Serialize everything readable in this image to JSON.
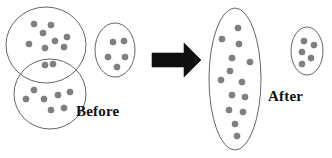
{
  "figure": {
    "background_color": "#ffffff",
    "outline_color": "#555555",
    "dot_color": "#808080",
    "dot_edge_color": "#6e6e6e",
    "arrow_color": "#111111",
    "caption_color": "#111111"
  },
  "captions": {
    "before": "Before",
    "after": "After"
  },
  "chart_data": {
    "type": "scatter",
    "xlabel": "",
    "ylabel": "",
    "xlim": [
      0,
      332
    ],
    "ylim": [
      0,
      158
    ],
    "grid": false,
    "legend": false,
    "annotations": [
      "Before",
      "After"
    ],
    "groups": [
      {
        "name": "before-top-left-cluster",
        "side": "before",
        "shape": "circle",
        "cx": 46,
        "cy": 45,
        "rx": 40,
        "ry": 38,
        "rotation": 0,
        "point_count": 8,
        "points": [
          {
            "x": 34,
            "y": 24
          },
          {
            "x": 51,
            "y": 25
          },
          {
            "x": 43,
            "y": 33
          },
          {
            "x": 67,
            "y": 37
          },
          {
            "x": 29,
            "y": 44
          },
          {
            "x": 45,
            "y": 48
          },
          {
            "x": 64,
            "y": 47
          },
          {
            "x": 55,
            "y": 41
          }
        ]
      },
      {
        "name": "before-bottom-left-cluster",
        "side": "before",
        "shape": "circle",
        "cx": 50,
        "cy": 94,
        "rx": 36,
        "ry": 35,
        "rotation": 0,
        "point_count": 9,
        "points": [
          {
            "x": 45,
            "y": 65
          },
          {
            "x": 53,
            "y": 64
          },
          {
            "x": 34,
            "y": 90
          },
          {
            "x": 26,
            "y": 99
          },
          {
            "x": 44,
            "y": 99
          },
          {
            "x": 58,
            "y": 95
          },
          {
            "x": 70,
            "y": 92
          },
          {
            "x": 51,
            "y": 110
          },
          {
            "x": 64,
            "y": 108
          }
        ]
      },
      {
        "name": "before-right-cluster",
        "side": "before",
        "shape": "ellipse",
        "cx": 115,
        "cy": 50,
        "rx": 20,
        "ry": 27,
        "rotation": 0,
        "point_count": 5,
        "points": [
          {
            "x": 113,
            "y": 42
          },
          {
            "x": 124,
            "y": 41
          },
          {
            "x": 108,
            "y": 57
          },
          {
            "x": 125,
            "y": 57
          },
          {
            "x": 117,
            "y": 67
          }
        ]
      },
      {
        "name": "after-merged-cluster",
        "side": "after",
        "shape": "ellipse",
        "cx": 235,
        "cy": 79,
        "rx": 26,
        "ry": 71,
        "rotation": 0,
        "point_count": 14,
        "points": [
          {
            "x": 238,
            "y": 28
          },
          {
            "x": 222,
            "y": 39
          },
          {
            "x": 239,
            "y": 44
          },
          {
            "x": 232,
            "y": 58
          },
          {
            "x": 250,
            "y": 62
          },
          {
            "x": 230,
            "y": 71
          },
          {
            "x": 221,
            "y": 80
          },
          {
            "x": 242,
            "y": 82
          },
          {
            "x": 232,
            "y": 95
          },
          {
            "x": 245,
            "y": 97
          },
          {
            "x": 229,
            "y": 110
          },
          {
            "x": 243,
            "y": 112
          },
          {
            "x": 235,
            "y": 124
          },
          {
            "x": 237,
            "y": 136
          }
        ]
      },
      {
        "name": "after-small-cluster",
        "side": "after",
        "shape": "ellipse",
        "cx": 307,
        "cy": 51,
        "rx": 16,
        "ry": 24,
        "rotation": 0,
        "point_count": 5,
        "points": [
          {
            "x": 304,
            "y": 41
          },
          {
            "x": 314,
            "y": 45
          },
          {
            "x": 302,
            "y": 52
          },
          {
            "x": 311,
            "y": 58
          },
          {
            "x": 302,
            "y": 64
          }
        ]
      }
    ],
    "arrow": {
      "name": "transformation-arrow",
      "direction": "right",
      "x_start": 152,
      "x_end": 201,
      "y_center": 60,
      "shaft_thickness": 14,
      "head_height": 34
    }
  }
}
